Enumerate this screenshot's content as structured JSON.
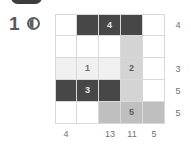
{
  "header": {
    "badge_label": "",
    "question_number": "1",
    "icon_name": "contrast-circle-icon"
  },
  "colors": {
    "white": "#ffffff",
    "lighter": "#f0f0f0",
    "light": "#eaeaea",
    "mid": "#d4d4d4",
    "gray": "#bfbfbf",
    "dark": "#474747",
    "gridline": "#d7d9da",
    "label_text": "#6e7275"
  },
  "chart_data": {
    "type": "heatmap",
    "title": "",
    "xlabel": "",
    "ylabel": "",
    "rows": 5,
    "cols": 5,
    "grid": true,
    "legend": "none",
    "row_labels": [
      "4",
      "",
      "3",
      "5",
      "5"
    ],
    "col_labels": [
      "4",
      "",
      "13",
      "11",
      "5"
    ],
    "cells": [
      [
        {
          "shade": "white",
          "value": ""
        },
        {
          "shade": "dark",
          "value": ""
        },
        {
          "shade": "dark",
          "value": "4"
        },
        {
          "shade": "dark",
          "value": ""
        },
        {
          "shade": "white",
          "value": ""
        }
      ],
      [
        {
          "shade": "white",
          "value": ""
        },
        {
          "shade": "white",
          "value": ""
        },
        {
          "shade": "white",
          "value": ""
        },
        {
          "shade": "mid",
          "value": ""
        },
        {
          "shade": "white",
          "value": ""
        }
      ],
      [
        {
          "shade": "lighter",
          "value": ""
        },
        {
          "shade": "lighter",
          "value": "1"
        },
        {
          "shade": "lighter",
          "value": ""
        },
        {
          "shade": "mid",
          "value": "2"
        },
        {
          "shade": "white",
          "value": ""
        }
      ],
      [
        {
          "shade": "dark",
          "value": ""
        },
        {
          "shade": "dark",
          "value": "3"
        },
        {
          "shade": "dark",
          "value": ""
        },
        {
          "shade": "mid",
          "value": ""
        },
        {
          "shade": "white",
          "value": ""
        }
      ],
      [
        {
          "shade": "white",
          "value": ""
        },
        {
          "shade": "white",
          "value": ""
        },
        {
          "shade": "gray",
          "value": ""
        },
        {
          "shade": "gray",
          "value": "5"
        },
        {
          "shade": "gray",
          "value": ""
        }
      ]
    ]
  }
}
